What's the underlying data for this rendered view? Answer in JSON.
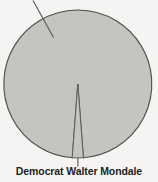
{
  "chart_data": {
    "type": "pie",
    "title": "",
    "subtitle": "",
    "xlabel": "",
    "ylabel": "",
    "grid": false,
    "legend_position": "none",
    "labels": [
      "Republican Ronald Reagan",
      "Democrat Walter Mondale"
    ],
    "values": [
      97.6,
      2.4
    ],
    "slices": [
      {
        "label": "Republican Ronald Reagan",
        "value": 97.6,
        "color": "#c5c4c1",
        "labeled_on_chart": false,
        "start_angle_deg": 182.5,
        "end_angle_deg": 537.5
      },
      {
        "label": "Democrat Walter Mondale",
        "value": 2.4,
        "color": "#c5c4c1",
        "labeled_on_chart": true,
        "start_angle_deg": 177.5,
        "end_angle_deg": 182.5
      }
    ],
    "annotations": [
      {
        "text": "Democrat Walter Mondale",
        "target": "thin-bottom-slice",
        "leader": "vertical-line-from-pie-bottom"
      },
      {
        "text": "",
        "target": "large-slice",
        "leader": "diagonal-line-top-left-unlabeled"
      }
    ]
  },
  "chart": {
    "fill_color": "#c5c4c1",
    "stroke_color": "#4d4b4b",
    "background_color": "#f5f4f2",
    "leader_color": "#5a5858",
    "label_color": "#211f1f"
  },
  "callout": {
    "mondale_label": "Democrat Walter Mondale"
  }
}
